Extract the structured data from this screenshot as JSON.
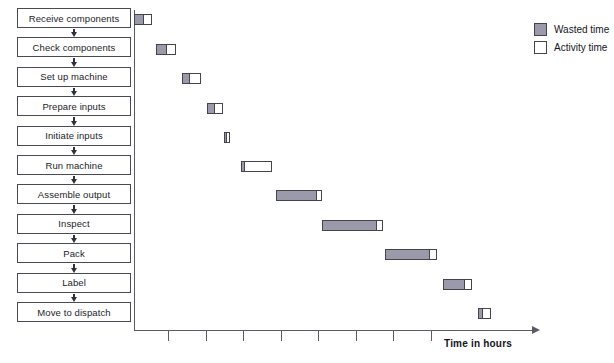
{
  "flowchart": {
    "steps": [
      {
        "label": "Receive components"
      },
      {
        "label": "Check components"
      },
      {
        "label": "Set up machine"
      },
      {
        "label": "Prepare inputs"
      },
      {
        "label": "Initiate inputs"
      },
      {
        "label": "Run machine"
      },
      {
        "label": "Assemble output"
      },
      {
        "label": "Inspect"
      },
      {
        "label": "Pack"
      },
      {
        "label": "Label"
      },
      {
        "label": "Move to dispatch"
      }
    ]
  },
  "legend": {
    "position": "top-right",
    "entries": [
      {
        "label": "Wasted time",
        "color": "#9a9aab"
      },
      {
        "label": "Activity time",
        "color": "#ffffff"
      }
    ]
  },
  "axis": {
    "xlabel": "Time in hours",
    "tick_count": 8,
    "tick_positions_px": [
      34,
      72,
      109,
      147,
      184,
      222,
      259,
      297
    ]
  },
  "colors": {
    "wasted": "#9a9aab",
    "activity": "#ffffff",
    "outline": "#44444f",
    "axis": "#5b5b66",
    "text": "#14141e"
  },
  "chart_data": {
    "type": "bar",
    "orientation": "horizontal-gantt",
    "title": "",
    "xlabel": "Time in hours",
    "ylabel": "",
    "categories": [
      "Receive components",
      "Check components",
      "Set up machine",
      "Prepare inputs",
      "Initiate inputs",
      "Run machine",
      "Assemble output",
      "Inspect",
      "Pack",
      "Label",
      "Move to dispatch"
    ],
    "series": [
      {
        "name": "Wasted time",
        "color": "#9a9aab"
      },
      {
        "name": "Activity time",
        "color": "#ffffff"
      }
    ],
    "grid": false,
    "bars": [
      {
        "category": "Receive components",
        "start": 0,
        "wasted": 10,
        "activity": 8,
        "top": 14
      },
      {
        "category": "Check components",
        "start": 22,
        "wasted": 11,
        "activity": 9,
        "top": 44
      },
      {
        "category": "Set up machine",
        "start": 48,
        "wasted": 8,
        "activity": 11,
        "top": 73
      },
      {
        "category": "Prepare inputs",
        "start": 73,
        "wasted": 8,
        "activity": 8,
        "top": 103
      },
      {
        "category": "Initiate inputs",
        "start": 90,
        "wasted": 3,
        "activity": 3,
        "top": 132
      },
      {
        "category": "Run machine",
        "start": 107,
        "wasted": 4,
        "activity": 27,
        "top": 161
      },
      {
        "category": "Assemble output",
        "start": 142,
        "wasted": 41,
        "activity": 5,
        "top": 190
      },
      {
        "category": "Inspect",
        "start": 188,
        "wasted": 55,
        "activity": 6,
        "top": 220
      },
      {
        "category": "Pack",
        "start": 251,
        "wasted": 45,
        "activity": 7,
        "top": 249
      },
      {
        "category": "Label",
        "start": 309,
        "wasted": 22,
        "activity": 7,
        "top": 279
      },
      {
        "category": "Move to dispatch",
        "start": 344,
        "wasted": 5,
        "activity": 8,
        "top": 308
      }
    ]
  }
}
